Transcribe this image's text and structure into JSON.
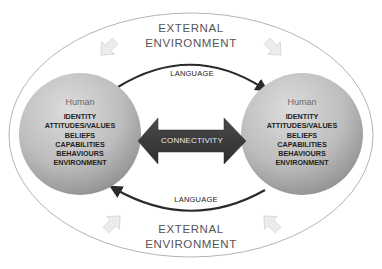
{
  "diagram": {
    "outer_label_top": [
      "EXTERNAL",
      "ENVIRONMENT"
    ],
    "outer_label_bottom": [
      "EXTERNAL",
      "ENVIRONMENT"
    ],
    "language_top": "LANGUAGE",
    "language_bottom": "LANGUAGE",
    "connector": "CONNECTIVITY",
    "left_human": {
      "title": "Human",
      "attributes": [
        "IDENTITY",
        "ATTITUDES/VALUES",
        "BELIEFS",
        "CAPABILITIES",
        "BEHAVIOURS",
        "ENVIRONMENT"
      ]
    },
    "right_human": {
      "title": "Human",
      "attributes": [
        "IDENTITY",
        "ATTITUDES/VALUES",
        "BELIEFS",
        "CAPABILITIES",
        "BEHAVIOURS",
        "ENVIRONMENT"
      ]
    },
    "colors": {
      "outer_ellipse": "#9a9a9a",
      "circle_light": "#d6d6d6",
      "circle_dark": "#9e9e9e",
      "connector_arrow": "#3a3a3a",
      "language_arc": "#2a2a2a",
      "env_arrows": "#e4e4e4"
    }
  }
}
